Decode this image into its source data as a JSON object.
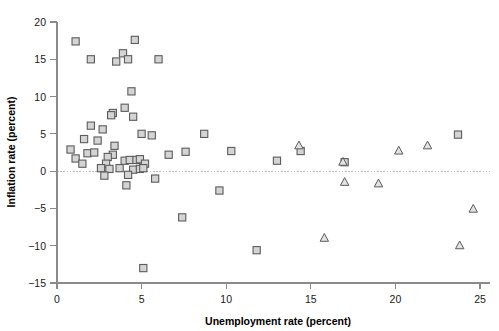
{
  "chart_data": {
    "type": "scatter",
    "title": "",
    "xlabel": "Unemployment rate (percent)",
    "ylabel": "Inflation rate (percent)",
    "xlim": [
      0,
      25
    ],
    "ylim": [
      -15,
      20
    ],
    "xticks": [
      0,
      5,
      10,
      15,
      20,
      25
    ],
    "yticks": [
      -15,
      -10,
      -5,
      0,
      5,
      10,
      15,
      20
    ],
    "xticklabels": [
      "0",
      "5",
      "10",
      "15",
      "20",
      "25"
    ],
    "yticklabels": [
      "−15",
      "−10",
      "−5",
      "0",
      "5",
      "10",
      "15",
      "20"
    ],
    "grid": false,
    "legend": "none",
    "reference_lines": [
      {
        "axis": "y",
        "value": 0,
        "style": "dotted",
        "color": "#b8b8b8"
      },
      {
        "axis": "y",
        "value": -15,
        "style": "dotted",
        "color": "#b8b8b8"
      }
    ],
    "series": [
      {
        "name": "square-series",
        "marker": "square",
        "fill": "#d4d4d4",
        "edge": "#5c5c5c",
        "points": [
          [
            1.1,
            17.4
          ],
          [
            2.0,
            15.0
          ],
          [
            3.5,
            14.7
          ],
          [
            3.9,
            15.8
          ],
          [
            4.2,
            15.0
          ],
          [
            4.6,
            17.6
          ],
          [
            6.0,
            15.0
          ],
          [
            4.4,
            10.7
          ],
          [
            4.0,
            8.5
          ],
          [
            3.3,
            7.8
          ],
          [
            3.2,
            7.5
          ],
          [
            4.5,
            7.3
          ],
          [
            2.0,
            6.1
          ],
          [
            2.7,
            5.6
          ],
          [
            5.0,
            5.0
          ],
          [
            5.6,
            4.8
          ],
          [
            8.7,
            5.0
          ],
          [
            23.7,
            4.9
          ],
          [
            1.6,
            4.3
          ],
          [
            2.4,
            4.1
          ],
          [
            0.8,
            2.9
          ],
          [
            1.8,
            2.4
          ],
          [
            2.2,
            2.5
          ],
          [
            1.1,
            1.7
          ],
          [
            1.5,
            1.0
          ],
          [
            3.4,
            3.4
          ],
          [
            3.3,
            2.2
          ],
          [
            3.0,
            1.9
          ],
          [
            4.0,
            1.4
          ],
          [
            4.3,
            1.5
          ],
          [
            4.7,
            1.5
          ],
          [
            4.9,
            1.6
          ],
          [
            5.2,
            1.0
          ],
          [
            6.6,
            2.2
          ],
          [
            7.6,
            2.6
          ],
          [
            10.3,
            2.7
          ],
          [
            13.0,
            1.4
          ],
          [
            14.4,
            2.7
          ],
          [
            17.0,
            1.2
          ],
          [
            2.9,
            1.0
          ],
          [
            2.6,
            0.4
          ],
          [
            3.1,
            0.3
          ],
          [
            3.7,
            0.4
          ],
          [
            4.5,
            0.2
          ],
          [
            4.9,
            0.3
          ],
          [
            5.1,
            0.4
          ],
          [
            2.8,
            -0.6
          ],
          [
            4.2,
            -0.5
          ],
          [
            4.1,
            -1.9
          ],
          [
            5.8,
            -1.0
          ],
          [
            9.6,
            -2.6
          ],
          [
            7.4,
            -6.2
          ],
          [
            11.8,
            -10.6
          ],
          [
            5.1,
            -13.0
          ]
        ]
      },
      {
        "name": "triangle-series",
        "marker": "triangle",
        "fill": "#e2e2e2",
        "edge": "#5c5c5c",
        "points": [
          [
            14.3,
            3.4
          ],
          [
            16.9,
            1.2
          ],
          [
            17.0,
            -1.5
          ],
          [
            19.0,
            -1.7
          ],
          [
            20.2,
            2.7
          ],
          [
            21.9,
            3.4
          ],
          [
            15.8,
            -9.0
          ],
          [
            24.6,
            -5.1
          ],
          [
            23.8,
            -10.0
          ]
        ]
      }
    ]
  },
  "axes": {
    "x_title": "Unemployment rate (percent)",
    "y_title": "Inflation rate (percent)"
  }
}
